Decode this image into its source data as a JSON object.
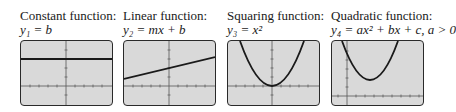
{
  "panels": [
    {
      "title": "Constant function:",
      "equation": "y₁ = b",
      "graph": "horizontal-line"
    },
    {
      "title": "Linear function:",
      "equation": "y₂ = mx + b",
      "graph": "sloped-line"
    },
    {
      "title": "Squaring function:",
      "equation": "y₃ = x²",
      "graph": "parabola-at-origin"
    },
    {
      "title": "Quadratic function:",
      "equation": "y₄ = ax² + bx + c, a > 0",
      "graph": "parabola-shifted"
    }
  ],
  "colors": {
    "screen_bg": "#d9d9d9",
    "curve": "#1a1a1a",
    "axis": "#555555",
    "border": "#2a2a2a"
  }
}
